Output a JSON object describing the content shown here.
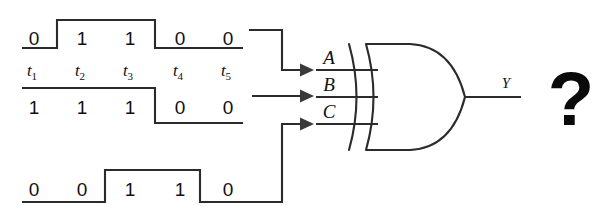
{
  "figure": {
    "question_mark": "?",
    "colors": {
      "ink": "#2b2b2b",
      "text": "#111111",
      "background": "#ffffff"
    }
  },
  "time_axis": {
    "labels": [
      "t",
      "t",
      "t",
      "t",
      "t"
    ],
    "subscripts": [
      "1",
      "2",
      "3",
      "4",
      "5"
    ],
    "slot_centers_px": [
      34,
      82,
      130,
      178,
      226
    ]
  },
  "waveforms": [
    {
      "name": "waveform-a",
      "feeds_input": "A",
      "bits": [
        "0",
        "1",
        "1",
        "0",
        "0"
      ],
      "values": [
        0,
        1,
        1,
        0,
        0
      ],
      "baseline_y": 48,
      "high_y": 20
    },
    {
      "name": "waveform-b",
      "feeds_input": "B",
      "bits": [
        "1",
        "1",
        "1",
        "0",
        "0"
      ],
      "values": [
        1,
        1,
        1,
        0,
        0
      ],
      "baseline_y": 123,
      "high_y": 88
    },
    {
      "name": "waveform-c",
      "feeds_input": "C",
      "bits": [
        "0",
        "0",
        "1",
        "1",
        "0"
      ],
      "values": [
        0,
        0,
        1,
        1,
        0
      ],
      "baseline_y": 202,
      "high_y": 170
    }
  ],
  "gate": {
    "type": "XOR",
    "input_labels": [
      "A",
      "B",
      "C"
    ],
    "output_label": "Y"
  }
}
